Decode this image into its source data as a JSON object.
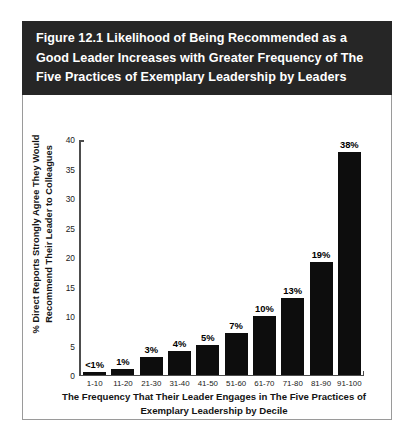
{
  "figure": {
    "title": "Figure 12.1  Likelihood of Being Recommended as a\nGood Leader Increases with Greater Frequency of The\nFive Practices of Exemplary Leadership by Leaders",
    "title_bar_color": "#262626",
    "title_text_color": "#ffffff",
    "panel_background": "#ffffff",
    "panel_border_color": "#9a9a9a"
  },
  "chart_data": {
    "type": "bar",
    "title": "Figure 12.1  Likelihood of Being Recommended as a Good Leader Increases with Greater Frequency of The Five Practices of Exemplary Leadership by Leaders",
    "categories": [
      "1-10",
      "11-20",
      "21-30",
      "31-40",
      "41-50",
      "51-60",
      "61-70",
      "71-80",
      "81-90",
      "91-100"
    ],
    "values": [
      0.4,
      1,
      3,
      4,
      5,
      7,
      10,
      13,
      19,
      38
    ],
    "data_labels": [
      "<1%",
      "1%",
      "3%",
      "4%",
      "5%",
      "7%",
      "10%",
      "13%",
      "19%",
      "38%"
    ],
    "xlabel": "The Frequency That Their Leader Engages in The Five Practices of\nExemplary Leadership by Decile",
    "ylabel": "% Direct Reports Strongly Agree They Would\nRecommend Their Leader to Colleagues",
    "ylim": [
      0,
      40
    ],
    "yticks": [
      "0",
      "5",
      "10",
      "15",
      "20",
      "25",
      "30",
      "35",
      "40"
    ],
    "ytick_values": [
      0,
      5,
      10,
      15,
      20,
      25,
      30,
      35,
      40
    ],
    "grid": false,
    "legend": false,
    "bar_color": "#0d0d0d",
    "axis_color": "#4d4d4d"
  }
}
